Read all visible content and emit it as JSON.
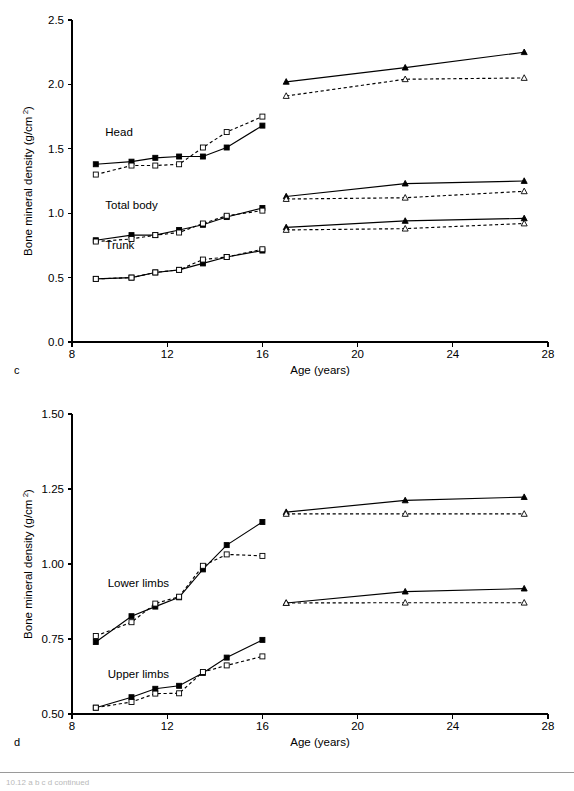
{
  "figure": {
    "background": "#ffffff",
    "axis_color": "#000000",
    "footer_caption": "10.12 a b c d continued"
  },
  "chart_data": [
    {
      "id": "panel-c",
      "panel_letter": "c",
      "type": "line",
      "title": "",
      "xlabel": "Age (years)",
      "ylabel": "Bone mineral density (g/cm 2)",
      "ylabel_base": "Bone mineral density (g/cm",
      "ylabel_sup": "2",
      "ylabel_tail": ")",
      "xlim": [
        8,
        28
      ],
      "ylim": [
        0.0,
        2.5
      ],
      "xticks": [
        8,
        12,
        16,
        20,
        24,
        28
      ],
      "xticklabels": [
        "8",
        "12",
        "16",
        "20",
        "24",
        "28"
      ],
      "yticks": [
        0.0,
        0.5,
        1.0,
        1.5,
        2.0,
        2.5
      ],
      "yticklabels": [
        "0.0",
        "0.5",
        "1.0",
        "1.5",
        "2.0",
        "2.5"
      ],
      "grid": false,
      "legend": "none",
      "annotations": [
        {
          "text": "Head",
          "x": 9.4,
          "y": 1.6
        },
        {
          "text": "Total body",
          "x": 9.4,
          "y": 1.03
        },
        {
          "text": "Trunk",
          "x": 9.4,
          "y": 0.72
        }
      ],
      "series": [
        {
          "name": "Head - boys (children)",
          "marker": "filled-square",
          "line": "solid",
          "x": [
            9.0,
            10.5,
            11.5,
            12.5,
            13.5,
            14.5,
            16.0
          ],
          "values": [
            1.38,
            1.4,
            1.43,
            1.44,
            1.44,
            1.51,
            1.68
          ]
        },
        {
          "name": "Head - girls (children)",
          "marker": "open-square",
          "line": "dashed",
          "x": [
            9.0,
            10.5,
            11.5,
            12.5,
            13.5,
            14.5,
            16.0
          ],
          "values": [
            1.3,
            1.37,
            1.37,
            1.38,
            1.51,
            1.63,
            1.75
          ]
        },
        {
          "name": "Head - men (adults)",
          "marker": "filled-triangle",
          "line": "solid",
          "x": [
            17.0,
            22.0,
            27.0
          ],
          "values": [
            2.02,
            2.13,
            2.25
          ]
        },
        {
          "name": "Head - women (adults)",
          "marker": "open-triangle",
          "line": "dashed",
          "x": [
            17.0,
            22.0,
            27.0
          ],
          "values": [
            1.91,
            2.04,
            2.05
          ]
        },
        {
          "name": "Total body - boys (children)",
          "marker": "filled-square",
          "line": "solid",
          "x": [
            9.0,
            10.5,
            11.5,
            12.5,
            13.5,
            14.5,
            16.0
          ],
          "values": [
            0.79,
            0.83,
            0.83,
            0.87,
            0.91,
            0.97,
            1.04
          ]
        },
        {
          "name": "Total body - girls (children)",
          "marker": "open-square",
          "line": "dashed",
          "x": [
            9.0,
            10.5,
            11.5,
            12.5,
            13.5,
            14.5,
            16.0
          ],
          "values": [
            0.78,
            0.8,
            0.83,
            0.85,
            0.92,
            0.98,
            1.02
          ]
        },
        {
          "name": "Total body - men (adults)",
          "marker": "filled-triangle",
          "line": "solid",
          "x": [
            17.0,
            22.0,
            27.0
          ],
          "values": [
            1.13,
            1.23,
            1.25
          ]
        },
        {
          "name": "Total body - women (adults)",
          "marker": "open-triangle",
          "line": "dashed",
          "x": [
            17.0,
            22.0,
            27.0
          ],
          "values": [
            1.11,
            1.12,
            1.17
          ]
        },
        {
          "name": "Trunk - boys (children)",
          "marker": "filled-square",
          "line": "solid",
          "x": [
            9.0,
            10.5,
            11.5,
            12.5,
            13.5,
            14.5,
            16.0
          ],
          "values": [
            0.49,
            0.5,
            0.54,
            0.56,
            0.61,
            0.66,
            0.71
          ]
        },
        {
          "name": "Trunk - girls (children)",
          "marker": "open-square",
          "line": "dashed",
          "x": [
            9.0,
            10.5,
            11.5,
            12.5,
            13.5,
            14.5,
            16.0
          ],
          "values": [
            0.49,
            0.5,
            0.54,
            0.56,
            0.64,
            0.66,
            0.72
          ]
        },
        {
          "name": "Trunk - men (adults)",
          "marker": "filled-triangle",
          "line": "solid",
          "x": [
            17.0,
            22.0,
            27.0
          ],
          "values": [
            0.89,
            0.94,
            0.96
          ]
        },
        {
          "name": "Trunk - women (adults)",
          "marker": "open-triangle",
          "line": "dashed",
          "x": [
            17.0,
            22.0,
            27.0
          ],
          "values": [
            0.87,
            0.88,
            0.92
          ]
        }
      ]
    },
    {
      "id": "panel-d",
      "panel_letter": "d",
      "type": "line",
      "title": "",
      "xlabel": "Age (years)",
      "ylabel": "Bone mineral density (g/cm 2)",
      "ylabel_base": "Bone mineral density (g/cm",
      "ylabel_sup": "2",
      "ylabel_tail": ")",
      "xlim": [
        8,
        28
      ],
      "ylim": [
        0.5,
        1.5
      ],
      "xticks": [
        8,
        12,
        16,
        20,
        24,
        28
      ],
      "xticklabels": [
        "8",
        "12",
        "16",
        "20",
        "24",
        "28"
      ],
      "yticks": [
        0.5,
        0.75,
        1.0,
        1.25,
        1.5
      ],
      "yticklabels": [
        "0.50",
        "0.75",
        "1.00",
        "1.25",
        "1.50"
      ],
      "grid": false,
      "legend": "none",
      "annotations": [
        {
          "text": "Lower limbs",
          "x": 9.5,
          "y": 0.925
        },
        {
          "text": "Upper limbs",
          "x": 9.5,
          "y": 0.62
        }
      ],
      "series": [
        {
          "name": "Lower limbs - boys (children)",
          "marker": "filled-square",
          "line": "solid",
          "x": [
            9.0,
            10.5,
            11.5,
            12.5,
            13.5,
            14.5,
            16.0
          ],
          "values": [
            0.74,
            0.826,
            0.858,
            0.889,
            0.982,
            1.063,
            1.14
          ]
        },
        {
          "name": "Lower limbs - girls (children)",
          "marker": "open-square",
          "line": "dashed",
          "x": [
            9.0,
            10.5,
            11.5,
            12.5,
            13.5,
            14.5,
            16.0
          ],
          "values": [
            0.76,
            0.806,
            0.868,
            0.891,
            0.994,
            1.032,
            1.027
          ]
        },
        {
          "name": "Lower limbs - men (adults)",
          "marker": "filled-triangle",
          "line": "solid",
          "x": [
            17.0,
            22.0,
            27.0
          ],
          "values": [
            1.173,
            1.212,
            1.223
          ]
        },
        {
          "name": "Lower limbs - women (adults)",
          "marker": "open-triangle",
          "line": "dashed",
          "x": [
            17.0,
            22.0,
            27.0
          ],
          "values": [
            1.167,
            1.167,
            1.167
          ]
        },
        {
          "name": "Upper limbs - boys (children)",
          "marker": "filled-square",
          "line": "solid",
          "x": [
            9.0,
            10.5,
            11.5,
            12.5,
            13.5,
            14.5,
            16.0
          ],
          "values": [
            0.521,
            0.556,
            0.584,
            0.594,
            0.637,
            0.688,
            0.747
          ]
        },
        {
          "name": "Upper limbs - girls (children)",
          "marker": "open-square",
          "line": "dashed",
          "x": [
            9.0,
            10.5,
            11.5,
            12.5,
            13.5,
            14.5,
            16.0
          ],
          "values": [
            0.521,
            0.54,
            0.568,
            0.569,
            0.64,
            0.662,
            0.692
          ]
        },
        {
          "name": "Upper limbs - men (adults)",
          "marker": "filled-triangle",
          "line": "solid",
          "x": [
            17.0,
            22.0,
            27.0
          ],
          "values": [
            0.87,
            0.908,
            0.918
          ]
        },
        {
          "name": "Upper limbs - women (adults)",
          "marker": "open-triangle",
          "line": "dashed",
          "x": [
            17.0,
            22.0,
            27.0
          ],
          "values": [
            0.87,
            0.871,
            0.871
          ]
        }
      ]
    }
  ]
}
